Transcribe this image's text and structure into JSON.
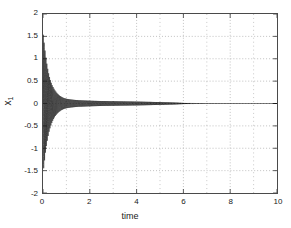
{
  "chart_data": {
    "type": "line",
    "title": "",
    "subtitle": "",
    "xlabel": "time",
    "ylabel": "x_1",
    "ylabel_base": "x",
    "ylabel_sub": "1",
    "xlim": [
      0,
      10
    ],
    "ylim": [
      -2,
      2
    ],
    "xticks": [
      0,
      2,
      4,
      6,
      8,
      10
    ],
    "xtick_labels": [
      "0",
      "2",
      "4",
      "6",
      "8",
      "10"
    ],
    "yticks": [
      -2,
      -1.5,
      -1,
      -0.5,
      0,
      0.5,
      1,
      1.5,
      2
    ],
    "ytick_labels": [
      "-2",
      "-1.5",
      "-1",
      "-0.5",
      "0",
      "0.5",
      "1",
      "1.5",
      "2"
    ],
    "grid": true,
    "grid_style": "dotted",
    "grid_color": "#b0b0b0",
    "minor_grid_x": [
      1,
      2,
      3,
      4,
      5,
      6,
      7,
      8,
      9
    ],
    "legend": null,
    "legend_position": "none",
    "axis_color": "#4a4a4a",
    "background": "#ffffff",
    "series": [
      {
        "name": "x_1",
        "color": "#1a1a1a",
        "linewidth": 0.6,
        "description": "high-frequency damped oscillation; envelope decays from +/-1.58 at t=0 toward 0",
        "envelope": {
          "t": [
            0.0,
            0.05,
            0.1,
            0.15,
            0.2,
            0.25,
            0.3,
            0.35,
            0.4,
            0.5,
            0.6,
            0.7,
            0.8,
            0.9,
            1.0,
            1.2,
            1.5,
            2.0,
            2.5,
            3.0,
            3.5,
            4.0,
            4.5,
            5.0,
            5.5,
            6.0,
            6.3,
            7.0,
            8.0,
            9.0,
            10.0
          ],
          "amplitude": [
            1.58,
            1.35,
            1.12,
            0.93,
            0.78,
            0.65,
            0.55,
            0.47,
            0.4,
            0.3,
            0.23,
            0.18,
            0.145,
            0.12,
            0.105,
            0.088,
            0.073,
            0.062,
            0.055,
            0.05,
            0.046,
            0.042,
            0.037,
            0.031,
            0.023,
            0.013,
            0.007,
            0.002,
            0.001,
            0.0005,
            0.0
          ]
        },
        "oscillation_frequency_hz": 26,
        "initial_peak": 1.58,
        "initial_trough": -1.56,
        "settles_near": 0.0,
        "settling_time": 6.3
      }
    ]
  },
  "figure": {
    "renderer": "matlab-style-plot"
  }
}
